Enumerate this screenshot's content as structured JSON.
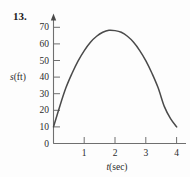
{
  "figure": {
    "number_label": "13.",
    "background_color": "#fdfdfd",
    "curve_color": "#4a4a4a",
    "axis_color": "#6f6f6f"
  },
  "chart_data": {
    "type": "line",
    "title": "",
    "subtitle": "",
    "xlabel": "t(sec)",
    "xlabel_variable": "t",
    "xlabel_unit": "(sec)",
    "ylabel": "s(ft)",
    "ylabel_variable": "s",
    "ylabel_unit": "(ft)",
    "xlim": [
      0,
      4.35
    ],
    "ylim": [
      0,
      78
    ],
    "xticks": [
      0,
      1,
      2,
      3,
      4
    ],
    "xtick_labels": [
      "0",
      "1",
      "2",
      "3",
      "4"
    ],
    "yticks": [
      0,
      10,
      20,
      30,
      40,
      50,
      60,
      70
    ],
    "ytick_labels": [
      "0",
      "10",
      "20",
      "30",
      "40",
      "50",
      "60",
      "70"
    ],
    "grid": false,
    "legend": "none",
    "series": [
      {
        "name": "s(t)",
        "x": [
          0.0,
          0.2,
          0.4,
          0.6,
          0.8,
          1.0,
          1.2,
          1.4,
          1.6,
          1.8,
          2.0,
          2.2,
          2.4,
          2.6,
          2.8,
          3.0,
          3.2,
          3.4,
          3.6,
          3.8,
          4.0
        ],
        "y": [
          10.0,
          22.2,
          33.4,
          42.2,
          49.8,
          56.0,
          61.0,
          64.6,
          67.0,
          68.2,
          68.0,
          67.0,
          64.6,
          61.0,
          56.0,
          49.8,
          42.2,
          33.4,
          22.2,
          15.0,
          10.0
        ]
      }
    ],
    "annotations": [
      {
        "text": "peak",
        "x": 2.0,
        "y": 74
      },
      {
        "text": "start",
        "x": 0.0,
        "y": 10
      },
      {
        "text": "end",
        "x": 4.0,
        "y": 10
      }
    ]
  }
}
